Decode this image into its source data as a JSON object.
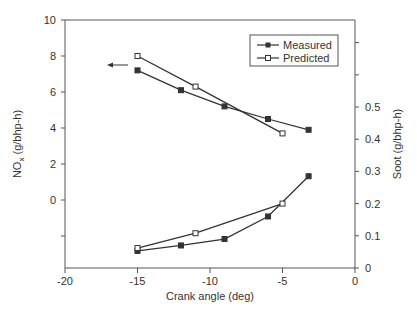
{
  "chart_data": {
    "type": "line",
    "title": "",
    "xlabel": "Crank angle (deg)",
    "ylabel_left": "NOx (g/bhp-h)",
    "ylabel_right": "Soot (g/bhp-h)",
    "xlim": [
      -20,
      0
    ],
    "ylim_left": [
      -3.8,
      10
    ],
    "ylim_right": [
      0,
      0.77
    ],
    "x_ticks": [
      -20,
      -15,
      -10,
      -5,
      0
    ],
    "x_tick_labels": [
      "-20",
      "-15",
      "-10",
      "-5",
      "0"
    ],
    "y_left_ticks": [
      10,
      8,
      6,
      4,
      2,
      0,
      -2
    ],
    "y_left_tick_labels": [
      "10",
      "8",
      "6",
      "4",
      "2",
      "0",
      ""
    ],
    "y_right_ticks": [
      0,
      0.1,
      0.2,
      0.3,
      0.4,
      0.5,
      0.6,
      0.7
    ],
    "y_right_tick_labels": [
      "0",
      "0.1",
      "0.2",
      "0.3",
      "0.4",
      "0.5",
      "",
      ""
    ],
    "grid": false,
    "legend_position": "upper right",
    "legend": [
      "Measured",
      "Predicted"
    ],
    "annotations": [
      {
        "type": "arrow",
        "direction": "left",
        "meaning": "NOx curves read on left axis",
        "x": -17,
        "y": 7.5
      }
    ],
    "series": [
      {
        "name": "Measured",
        "quantity": "NOx",
        "axis": "left",
        "marker": "filled-square",
        "x": [
          -15,
          -12,
          -9,
          -6,
          -3.2
        ],
        "y": [
          7.2,
          6.1,
          5.2,
          4.5,
          3.9
        ]
      },
      {
        "name": "Predicted",
        "quantity": "NOx",
        "axis": "left",
        "marker": "open-square",
        "x": [
          -15,
          -11,
          -5
        ],
        "y": [
          8.0,
          6.3,
          3.7
        ]
      },
      {
        "name": "Measured",
        "quantity": "Soot",
        "axis": "right",
        "marker": "filled-square",
        "x": [
          -15,
          -12,
          -9,
          -6,
          -3.2
        ],
        "y": [
          0.053,
          0.07,
          0.09,
          0.16,
          0.285
        ]
      },
      {
        "name": "Predicted",
        "quantity": "Soot",
        "axis": "right",
        "marker": "open-square",
        "x": [
          -15,
          -11,
          -5
        ],
        "y": [
          0.062,
          0.108,
          0.2
        ]
      }
    ]
  },
  "legend": {
    "measured_label": "Measured",
    "predicted_label": "Predicted"
  },
  "axes": {
    "x_title": "Crank angle (deg)",
    "y_left_title_main": "NO",
    "y_left_title_sub": "x",
    "y_left_title_rest": " (g/bhp-h)",
    "y_right_title": "Soot (g/bhp-h)"
  },
  "colors": {
    "line": "#333333",
    "axis": "#555555",
    "text": "#333333",
    "background": "#ffffff"
  }
}
